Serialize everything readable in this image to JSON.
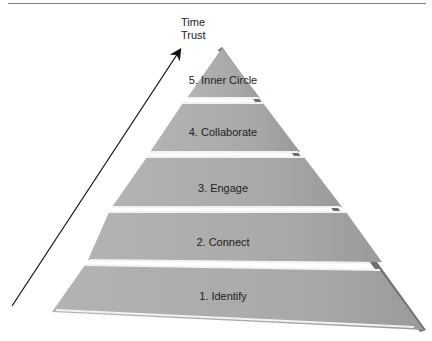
{
  "axis": {
    "line1": "Time",
    "line2": "Trust"
  },
  "pyramid": {
    "levels": [
      {
        "label": "5. Inner Circle"
      },
      {
        "label": "4. Collaborate"
      },
      {
        "label": "3. Engage"
      },
      {
        "label": "2. Connect"
      },
      {
        "label": "1. Identify"
      }
    ]
  },
  "colors": {
    "fill": "#a9a9a9",
    "highlight": "#f2f2f2",
    "edge": "#6e6e6e"
  }
}
